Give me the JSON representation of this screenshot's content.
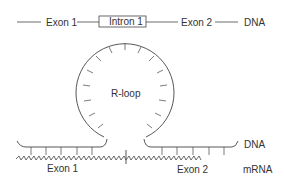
{
  "top_strand": {
    "labels": {
      "exon1": "Exon 1",
      "intron1": "Intron 1",
      "exon2": "Exon 2",
      "molecule": "DNA"
    }
  },
  "rloop": {
    "label": "R-loop"
  },
  "bottom": {
    "labels": {
      "dna": "DNA",
      "exon1": "Exon 1",
      "exon2": "Exon 2",
      "mrna": "mRNA"
    }
  },
  "colors": {
    "line": "#444444",
    "text": "#333333",
    "background": "#ffffff"
  }
}
